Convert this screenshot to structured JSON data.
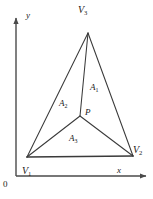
{
  "figure": {
    "background_color": "#ffffff",
    "line_color": "#3a3a3a",
    "axis_color": "#4a4a4a",
    "label_color": "#1a1a1a"
  },
  "axes": {
    "x_label": "x",
    "y_label": "y",
    "origin_label": "0",
    "x_axis": {
      "x1": 16,
      "y1": 176,
      "x2": 146,
      "y2": 176
    },
    "y_axis": {
      "x1": 16,
      "y1": 176,
      "x2": 16,
      "y2": 18
    }
  },
  "vertices": [
    {
      "id": "V1",
      "label": "V",
      "subscript": "1",
      "x": 27,
      "y": 157
    },
    {
      "id": "V2",
      "label": "V",
      "subscript": "2",
      "x": 133,
      "y": 156
    },
    {
      "id": "V3",
      "label": "V",
      "subscript": "3",
      "x": 88,
      "y": 33
    }
  ],
  "interior_point": {
    "id": "P",
    "label": "P",
    "x": 80,
    "y": 116
  },
  "areas": [
    {
      "id": "A1",
      "label": "A",
      "subscript": "1",
      "region": "right",
      "x": 90,
      "y": 83
    },
    {
      "id": "A2",
      "label": "A",
      "subscript": "2",
      "region": "left",
      "x": 59,
      "y": 99
    },
    {
      "id": "A3",
      "label": "A",
      "subscript": "3",
      "region": "bottom",
      "x": 69,
      "y": 134
    }
  ],
  "edges": [
    {
      "name": "V1-V2",
      "x1": 27,
      "y1": 157,
      "x2": 133,
      "y2": 156
    },
    {
      "name": "V2-V3",
      "x1": 133,
      "y1": 156,
      "x2": 88,
      "y2": 33
    },
    {
      "name": "V3-V1",
      "x1": 88,
      "y1": 33,
      "x2": 27,
      "y2": 157
    }
  ],
  "cevians": [
    {
      "name": "P-V1",
      "x1": 80,
      "y1": 116,
      "x2": 27,
      "y2": 157
    },
    {
      "name": "P-V2",
      "x1": 80,
      "y1": 116,
      "x2": 133,
      "y2": 156
    },
    {
      "name": "P-V3",
      "x1": 80,
      "y1": 116,
      "x2": 88,
      "y2": 33
    }
  ]
}
